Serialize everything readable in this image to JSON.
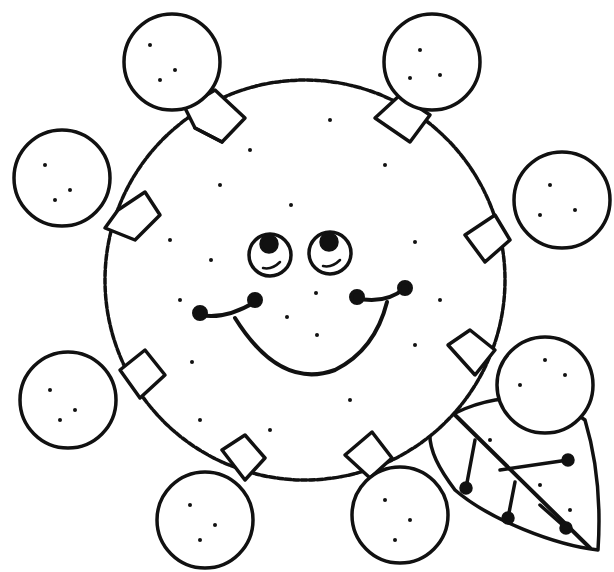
{
  "image": {
    "description": "Black and white coloring page line drawing of a smiling round sun/face character surrounded by eight round bulb-like circles attached by small square caps, with a leaf in the lower right",
    "stroke_color": "#111111",
    "background_color": "#ffffff"
  },
  "face": {
    "expression": "smile",
    "eyes": 2
  },
  "bulbs": {
    "count": 8
  },
  "leaf": {
    "count": 1
  }
}
